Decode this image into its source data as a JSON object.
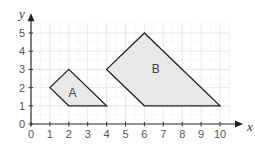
{
  "chart_data": {
    "type": "diagram",
    "title": "",
    "xlabel": "x",
    "ylabel": "y",
    "xlim": [
      0,
      10
    ],
    "ylim": [
      0,
      5
    ],
    "grid": true,
    "x_ticks": [
      "0",
      "1",
      "2",
      "3",
      "4",
      "5",
      "6",
      "7",
      "8",
      "9",
      "10"
    ],
    "y_ticks": [
      "0",
      "1",
      "2",
      "3",
      "4",
      "5"
    ],
    "shapes": [
      {
        "name": "A",
        "vertices": [
          [
            1,
            2
          ],
          [
            2,
            3
          ],
          [
            4,
            1
          ],
          [
            2,
            1
          ]
        ],
        "fill": "#e8e8e8"
      },
      {
        "name": "B",
        "vertices": [
          [
            4,
            3
          ],
          [
            6,
            5
          ],
          [
            10,
            1
          ],
          [
            6,
            1
          ]
        ],
        "fill": "#e8e8e8"
      }
    ],
    "label_positions": {
      "A": [
        2.2,
        1.7
      ],
      "B": [
        6.6,
        3.0
      ]
    }
  },
  "axes": {
    "x_label": "x",
    "y_label": "y"
  },
  "shapes": {
    "a_label": "A",
    "b_label": "B"
  },
  "colors": {
    "grid": "#e2e2e2",
    "axis": "#333333",
    "outline": "#222222",
    "fill": "#e8e8e8"
  }
}
